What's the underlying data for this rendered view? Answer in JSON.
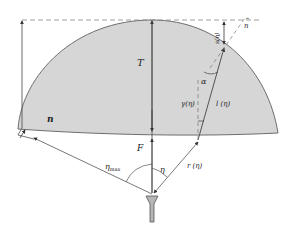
{
  "figure": {
    "corner_text": "",
    "labels": {
      "T": "T",
      "F": "F",
      "n": "n",
      "n_hat": "n",
      "n_hat_accent": "^",
      "s": "s(η)",
      "alpha": "α",
      "gamma": "γ(η)",
      "l": "l (η)",
      "r": "r (η)",
      "eta": "η",
      "eta_max_base": "η",
      "eta_max_sub": "max"
    },
    "colors": {
      "lens_fill": "#d6d6d6",
      "lens_stroke": "#6e6e6e",
      "line": "#555555",
      "dashed": "#888888",
      "feed_fill": "#b5b5b5"
    }
  }
}
